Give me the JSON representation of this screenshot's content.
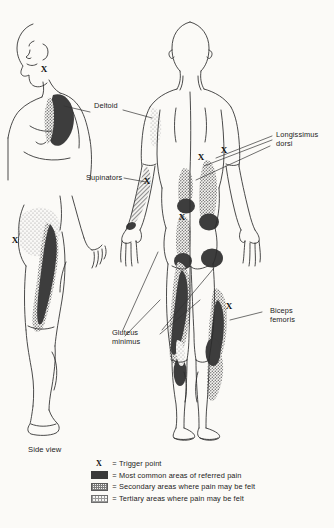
{
  "figure": {
    "side_view_caption": "Side view"
  },
  "muscle_labels": [
    {
      "id": "deltoid",
      "text": "Deltoid",
      "line1": "Deltoid",
      "line2": ""
    },
    {
      "id": "longissimus-dorsi",
      "text": "Longissimus dorsi",
      "line1": "Longissimus",
      "line2": "dorsi"
    },
    {
      "id": "supinators",
      "text": "Supinators",
      "line1": "Supinators",
      "line2": ""
    },
    {
      "id": "gluteus-minimus",
      "text": "Gluteus minimus",
      "line1": "Gluteus",
      "line2": "minimus"
    },
    {
      "id": "biceps-femoris",
      "text": "Biceps femoris",
      "line1": "Biceps",
      "line2": "femoris"
    }
  ],
  "legend": {
    "equals": "=",
    "items": [
      {
        "key": "trigger-point",
        "symbol": "X",
        "label": "Trigger point"
      },
      {
        "key": "primary",
        "symbol": "solid",
        "label": "Most common areas of referred pain"
      },
      {
        "key": "secondary",
        "symbol": "dense-dot",
        "label": "Secondary areas where pain may be felt"
      },
      {
        "key": "tertiary",
        "symbol": "light-dot",
        "label": "Tertiary areas where pain may be felt"
      }
    ]
  },
  "trigger_point_marker": "X",
  "colors": {
    "background": "#fbfaf7",
    "ink": "#1b1b1b",
    "outline": "#2b2b2b",
    "primary_pain": "#3a3a3a",
    "secondary_pain": "#8a8a8a",
    "tertiary_pain": "#b0b0b0",
    "leader_line": "#333333"
  },
  "views": [
    {
      "id": "upper-left-profile",
      "name": "Shoulder profile view (deltoid)"
    },
    {
      "id": "side-view-hip",
      "name": "Side view hip and thigh (gluteus minimus)"
    },
    {
      "id": "posterior-body",
      "name": "Posterior full body view"
    }
  ]
}
